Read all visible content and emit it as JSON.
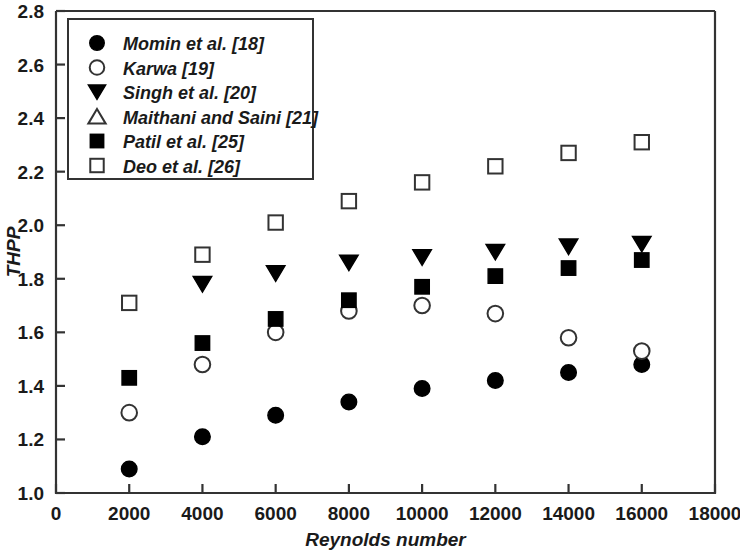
{
  "chart_data": {
    "type": "scatter",
    "title": "",
    "xlabel": "Reynolds number",
    "ylabel": "THPP",
    "xlim": [
      0,
      18000
    ],
    "ylim": [
      1.0,
      2.8
    ],
    "xticks": [
      0,
      2000,
      4000,
      6000,
      8000,
      10000,
      12000,
      14000,
      16000,
      18000
    ],
    "yticks": [
      1.0,
      1.2,
      1.4,
      1.6,
      1.8,
      2.0,
      2.2,
      2.4,
      2.6,
      2.8
    ],
    "xticklabels": [
      "0",
      "2000",
      "4000",
      "6000",
      "8000",
      "10000",
      "12000",
      "14000",
      "16000",
      "18000"
    ],
    "yticklabels": [
      "1.0",
      "1.2",
      "1.4",
      "1.6",
      "1.8",
      "2.0",
      "2.2",
      "2.4",
      "2.6",
      "2.8"
    ],
    "grid": false,
    "legend_position": "upper-left",
    "marker_color": "#000000",
    "series": [
      {
        "name": "Momin et al. [18]",
        "marker": "filled-circle",
        "x": [
          2000,
          4000,
          6000,
          8000,
          10000,
          12000,
          14000,
          16000
        ],
        "values": [
          1.09,
          1.21,
          1.29,
          1.34,
          1.39,
          1.42,
          1.45,
          1.48
        ]
      },
      {
        "name": "Karwa [19]",
        "marker": "open-circle",
        "x": [
          2000,
          4000,
          6000,
          8000,
          10000,
          12000,
          14000,
          16000
        ],
        "values": [
          1.3,
          1.48,
          1.6,
          1.68,
          1.7,
          1.67,
          1.58,
          1.53
        ]
      },
      {
        "name": "Singh et al. [20]",
        "marker": "filled-triangle-down",
        "x": [
          4000,
          6000,
          8000,
          10000,
          12000,
          14000,
          16000
        ],
        "values": [
          1.78,
          1.82,
          1.86,
          1.88,
          1.9,
          1.92,
          1.93
        ]
      },
      {
        "name": "Maithani and Saini  [21]",
        "marker": "open-triangle-up",
        "x": [],
        "values": []
      },
      {
        "name": "Patil et al. [25]",
        "marker": "filled-square",
        "x": [
          2000,
          4000,
          6000,
          8000,
          10000,
          12000,
          14000,
          16000
        ],
        "values": [
          1.43,
          1.56,
          1.65,
          1.72,
          1.77,
          1.81,
          1.84,
          1.87
        ]
      },
      {
        "name": "Deo et al. [26]",
        "marker": "open-square",
        "x": [
          2000,
          4000,
          6000,
          8000,
          10000,
          12000,
          14000,
          16000
        ],
        "values": [
          1.71,
          1.89,
          2.01,
          2.09,
          2.16,
          2.22,
          2.27,
          2.31
        ]
      }
    ]
  }
}
